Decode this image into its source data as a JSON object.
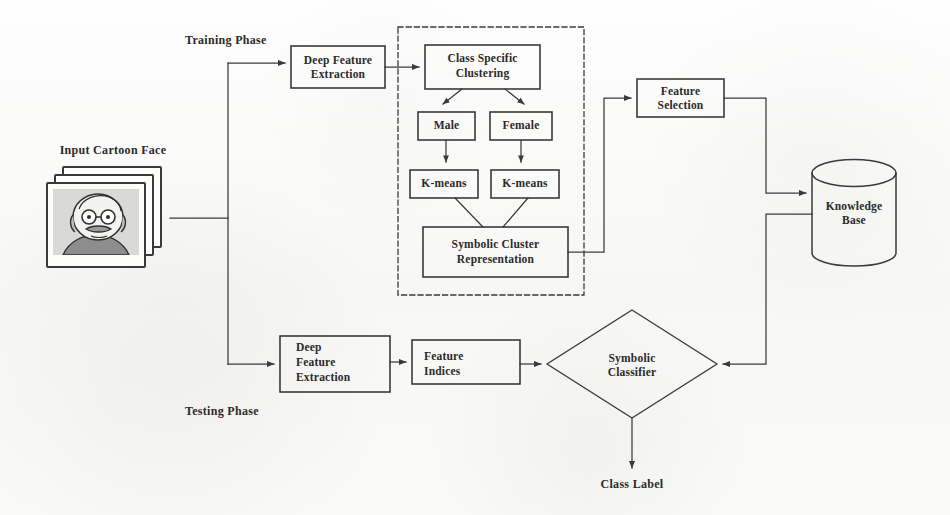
{
  "diagram": {
    "background_color": "#fbfbfa",
    "stroke_color": "#3a3a3a",
    "phases": {
      "training_label": "Training Phase",
      "testing_label": "Testing Phase"
    },
    "input": {
      "caption": "Input Cartoon Face",
      "icon": "image-stack-icon",
      "count": 3
    },
    "nodes": [
      {
        "id": "deep-feature-extraction-train",
        "label": "Deep Feature\nExtraction",
        "line1": "Deep Feature",
        "line2": "Extraction",
        "shape": "rect"
      },
      {
        "id": "class-specific-clustering",
        "label": "Class Specific\nClustering",
        "line1": "Class Specific",
        "line2": "Clustering",
        "shape": "rect"
      },
      {
        "id": "male",
        "label": "Male",
        "shape": "rect"
      },
      {
        "id": "female",
        "label": "Female",
        "shape": "rect"
      },
      {
        "id": "kmeans-male",
        "label": "K-means",
        "shape": "rect"
      },
      {
        "id": "kmeans-female",
        "label": "K-means",
        "shape": "rect"
      },
      {
        "id": "symbolic-cluster-representation",
        "label": "Symbolic Cluster\nRepresentation",
        "line1": "Symbolic Cluster",
        "line2": "Representation",
        "shape": "rect"
      },
      {
        "id": "feature-selection",
        "label": "Feature\nSelection",
        "line1": "Feature",
        "line2": "Selection",
        "shape": "rect"
      },
      {
        "id": "knowledge-base",
        "label": "Knowledge\nBase",
        "line1": "Knowledge",
        "line2": "Base",
        "shape": "cylinder"
      },
      {
        "id": "deep-feature-extraction-test",
        "label": "Deep\nFeature\nExtraction",
        "line1": "Deep",
        "line2": "Feature",
        "line3": "Extraction",
        "shape": "rect"
      },
      {
        "id": "feature-indices",
        "label": "Feature\nIndices",
        "line1": "Feature",
        "line2": "Indices",
        "shape": "rect"
      },
      {
        "id": "symbolic-classifier",
        "label": "Symbolic\nClassifier",
        "line1": "Symbolic",
        "line2": "Classifier",
        "shape": "diamond"
      }
    ],
    "output": {
      "label": "Class Label"
    },
    "dashed_group": {
      "id": "clustering-group",
      "style": "dashed"
    }
  }
}
